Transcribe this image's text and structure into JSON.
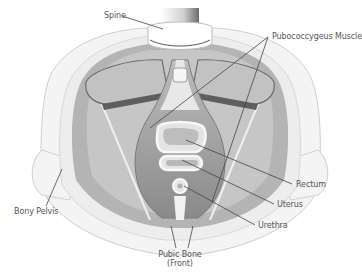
{
  "diagram": {
    "type": "anatomical-illustration",
    "labels": {
      "spine": "Spine",
      "pubococcygeus": "Pubococcygeus Muscle",
      "rectum": "Rectum",
      "uterus": "Uterus",
      "urethra": "Urethra",
      "bony_pelvis": "Bony Pelvis",
      "pubic_bone_line1": "Pubic Bone",
      "pubic_bone_line2": "(Front)"
    },
    "colors": {
      "background": "#ffffff",
      "bone": "#f2f2f2",
      "bone_outline": "#cfcfcf",
      "muscle_light": "#c8c8c8",
      "muscle_mid": "#a8a8a8",
      "muscle_dark": "#7a7a7a",
      "muscle_band": "#5a5a5a",
      "organ_fill": "#e6e6e6",
      "leader_line": "#444444",
      "label_text": "#555555"
    }
  }
}
